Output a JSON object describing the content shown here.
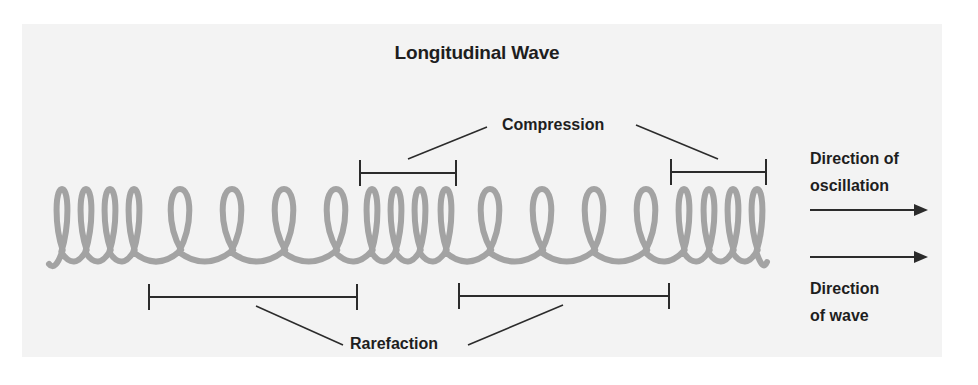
{
  "diagram": {
    "title": "Longitudinal Wave",
    "labels": {
      "compression": "Compression",
      "rarefaction": "Rarefaction",
      "direction_of_oscillation": [
        "Direction of",
        "oscillation"
      ],
      "direction_of_wave": [
        "Direction",
        "of wave"
      ]
    },
    "colors": {
      "spring": "#a3a3a3",
      "lines": "#2b2b2b",
      "text": "#1e1e1e",
      "panel": "#f3f3f3",
      "background": "#ffffff"
    },
    "spring": {
      "regions": [
        {
          "type": "compression",
          "coil_count": 4
        },
        {
          "type": "rarefaction",
          "coil_count": 4
        },
        {
          "type": "compression",
          "coil_count": 4
        },
        {
          "type": "rarefaction",
          "coil_count": 4
        },
        {
          "type": "compression",
          "coil_count": 4
        }
      ]
    },
    "brackets": {
      "compression": [
        "second compression region",
        "third compression region"
      ],
      "rarefaction": [
        "first rarefaction region",
        "second rarefaction region"
      ]
    },
    "arrows": [
      {
        "name": "direction-of-oscillation",
        "direction": "right"
      },
      {
        "name": "direction-of-wave",
        "direction": "right"
      }
    ]
  }
}
